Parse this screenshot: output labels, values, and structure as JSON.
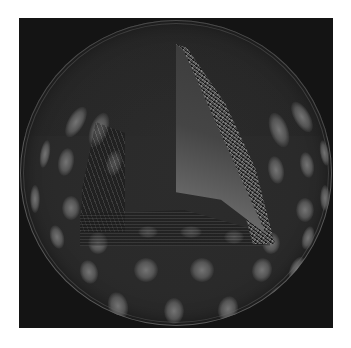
{
  "image": {
    "description": "Rendered 3D sphere with a periodic grid of bright elliptical blobs on a dark surface, with a wedge cut-away revealing an interior gradient face and a noisy band",
    "background_color": "#ffffff",
    "frame_color": "#141414",
    "sphere_base_color": "#2a2a2a",
    "blob_color": "#787878",
    "cutaway_highlight_color": "#cfcfcf"
  },
  "blobs": [
    {
      "x": 48,
      "y": 85,
      "w": 16,
      "h": 34,
      "r": 30
    },
    {
      "x": 70,
      "y": 92,
      "w": 18,
      "h": 36,
      "r": 20
    },
    {
      "x": 250,
      "y": 92,
      "w": 18,
      "h": 36,
      "r": -20
    },
    {
      "x": 274,
      "y": 80,
      "w": 16,
      "h": 34,
      "r": -30
    },
    {
      "x": 20,
      "y": 120,
      "w": 10,
      "h": 28,
      "r": 10
    },
    {
      "x": 38,
      "y": 128,
      "w": 16,
      "h": 28,
      "r": 10
    },
    {
      "x": 86,
      "y": 130,
      "w": 16,
      "h": 26,
      "r": 10
    },
    {
      "x": 248,
      "y": 136,
      "w": 16,
      "h": 28,
      "r": -10
    },
    {
      "x": 280,
      "y": 132,
      "w": 14,
      "h": 26,
      "r": -10
    },
    {
      "x": 300,
      "y": 120,
      "w": 9,
      "h": 26,
      "r": -10
    },
    {
      "x": 10,
      "y": 165,
      "w": 10,
      "h": 28,
      "r": 0
    },
    {
      "x": 42,
      "y": 176,
      "w": 18,
      "h": 24,
      "r": 0
    },
    {
      "x": 276,
      "y": 178,
      "w": 18,
      "h": 24,
      "r": 0
    },
    {
      "x": 300,
      "y": 165,
      "w": 10,
      "h": 26,
      "r": 0
    },
    {
      "x": 30,
      "y": 205,
      "w": 14,
      "h": 24,
      "r": -15
    },
    {
      "x": 68,
      "y": 212,
      "w": 20,
      "h": 22,
      "r": 0
    },
    {
      "x": 118,
      "y": 206,
      "w": 20,
      "h": 12,
      "r": 0
    },
    {
      "x": 160,
      "y": 206,
      "w": 22,
      "h": 12,
      "r": 0
    },
    {
      "x": 204,
      "y": 210,
      "w": 20,
      "h": 14,
      "r": 0
    },
    {
      "x": 242,
      "y": 212,
      "w": 18,
      "h": 22,
      "r": 0
    },
    {
      "x": 282,
      "y": 206,
      "w": 12,
      "h": 24,
      "r": 15
    },
    {
      "x": 60,
      "y": 240,
      "w": 18,
      "h": 24,
      "r": -15
    },
    {
      "x": 114,
      "y": 238,
      "w": 24,
      "h": 24,
      "r": 0
    },
    {
      "x": 170,
      "y": 238,
      "w": 24,
      "h": 24,
      "r": 0
    },
    {
      "x": 232,
      "y": 238,
      "w": 20,
      "h": 24,
      "r": 15
    },
    {
      "x": 270,
      "y": 236,
      "w": 14,
      "h": 26,
      "r": 25
    },
    {
      "x": 42,
      "y": 262,
      "w": 12,
      "h": 26,
      "r": -35
    },
    {
      "x": 88,
      "y": 272,
      "w": 20,
      "h": 28,
      "r": -15
    },
    {
      "x": 144,
      "y": 278,
      "w": 20,
      "h": 26,
      "r": 0
    },
    {
      "x": 198,
      "y": 276,
      "w": 20,
      "h": 26,
      "r": 15
    },
    {
      "x": 248,
      "y": 264,
      "w": 14,
      "h": 28,
      "r": 35
    }
  ]
}
